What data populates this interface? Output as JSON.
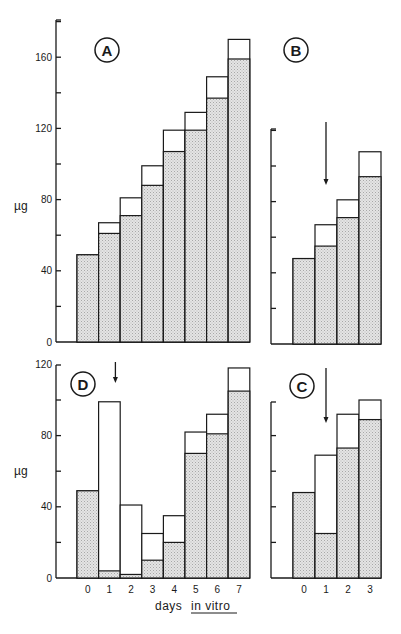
{
  "chart_data": [
    {
      "panel": "A",
      "type": "bar",
      "stacked_overlay": true,
      "categories": [
        "0",
        "1",
        "2",
        "3",
        "4",
        "5",
        "6",
        "7"
      ],
      "series": [
        {
          "name": "shaded (lower portion)",
          "values": [
            49,
            61,
            71,
            88,
            107,
            119,
            137,
            159
          ]
        },
        {
          "name": "total (open bar top)",
          "values": [
            49,
            67,
            81,
            99,
            119,
            129,
            149,
            170
          ]
        }
      ],
      "ylabel": "µg",
      "yticks": [
        0,
        40,
        80,
        120,
        160
      ],
      "ylim": [
        0,
        180
      ],
      "arrow_at_day": null
    },
    {
      "panel": "B",
      "type": "bar",
      "stacked_overlay": true,
      "categories": [
        "0",
        "1",
        "2",
        "3"
      ],
      "series": [
        {
          "name": "shaded (lower portion)",
          "values": [
            48,
            55,
            71,
            94
          ]
        },
        {
          "name": "total (open bar top)",
          "values": [
            48,
            67,
            81,
            108
          ]
        }
      ],
      "ylabel": "",
      "yticks": [
        0,
        20,
        40,
        60,
        80,
        100,
        120
      ],
      "ylim": [
        0,
        120
      ],
      "arrow_at_day": "1"
    },
    {
      "panel": "D",
      "type": "bar",
      "stacked_overlay": true,
      "categories": [
        "0",
        "1",
        "2",
        "3",
        "4",
        "5",
        "6",
        "7"
      ],
      "series": [
        {
          "name": "shaded (lower portion)",
          "values": [
            49,
            4,
            2,
            10,
            20,
            70,
            81,
            105
          ]
        },
        {
          "name": "total (open bar top)",
          "values": [
            49,
            99,
            41,
            25,
            35,
            82,
            92,
            118
          ]
        }
      ],
      "ylabel": "µg",
      "yticks": [
        0,
        40,
        80,
        120
      ],
      "ylim": [
        0,
        120
      ],
      "arrow_at_day": "1"
    },
    {
      "panel": "C",
      "type": "bar",
      "stacked_overlay": true,
      "categories": [
        "0",
        "1",
        "2",
        "3"
      ],
      "series": [
        {
          "name": "shaded (lower portion)",
          "values": [
            48,
            25,
            73,
            89
          ]
        },
        {
          "name": "total (open bar top)",
          "values": [
            48,
            69,
            92,
            100
          ]
        }
      ],
      "ylabel": "",
      "yticks": [
        0,
        20,
        40,
        60,
        80,
        100
      ],
      "ylim": [
        0,
        100
      ],
      "arrow_at_day": "1"
    }
  ],
  "figure": {
    "xlabel_prefix": "days ",
    "xlabel_underlined": "in vitro",
    "panel_labels": [
      "A",
      "B",
      "D",
      "C"
    ],
    "ylabel": "µg",
    "colors": {
      "ink": "#1a1a1a",
      "shade": "#d9d9d9",
      "background": "#ffffff"
    }
  }
}
